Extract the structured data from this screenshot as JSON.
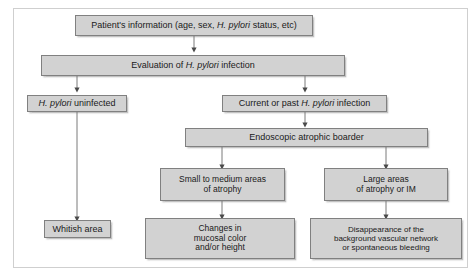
{
  "diagram": {
    "frame": {
      "border_color": "#cfcfcf",
      "background": "#ffffff"
    },
    "style": {
      "box_fill": "#d2d2d2",
      "box_border": "#808080",
      "text_color": "#1a1a1a",
      "connector_color": "#6e6e6e"
    },
    "nodes": [
      {
        "id": "patient-information",
        "label": "Patient's information (age, sex, H. pylori status, etc)",
        "italic_parts": [
          "H. pylori"
        ]
      },
      {
        "id": "evaluation-h-pylori-infection",
        "label": "Evaluation of H. pylori infection",
        "italic_parts": [
          "H. pylori"
        ]
      },
      {
        "id": "h-pylori-uninfected",
        "label": "H. pylori uninfected",
        "italic_parts": [
          "H. pylori"
        ]
      },
      {
        "id": "current-or-past-infection",
        "label": "Current or past H. pylori infection",
        "italic_parts": [
          "H. pylori"
        ]
      },
      {
        "id": "endoscopic-atrophic-boarder",
        "label": "Endoscopic atrophic boarder",
        "italic_parts": []
      },
      {
        "id": "small-to-medium-atrophy",
        "label": "Small to medium areas of atrophy",
        "lines": [
          "Small to medium areas",
          "of atrophy"
        ]
      },
      {
        "id": "large-areas-atrophy-im",
        "label": "Large areas of atrophy or IM",
        "lines": [
          "Large areas",
          "of atrophy or IM"
        ]
      },
      {
        "id": "whitish-area",
        "label": "Whitish area",
        "lines": [
          "Whitish area"
        ]
      },
      {
        "id": "changes-mucosal-color",
        "label": "Changes in mucosal color and/or height",
        "lines": [
          "Changes in",
          "mucosal color",
          "and/or height"
        ]
      },
      {
        "id": "disappearance-vascular-network",
        "label": "Disappearance of the background vascular network or spontaneous bleeding",
        "lines": [
          "Disappearance of the",
          "background vascular network",
          "or spontaneous bleeding"
        ]
      }
    ],
    "edges": [
      {
        "from": "patient-information",
        "to": "evaluation-h-pylori-infection"
      },
      {
        "from": "evaluation-h-pylori-infection",
        "to": "h-pylori-uninfected"
      },
      {
        "from": "evaluation-h-pylori-infection",
        "to": "current-or-past-infection"
      },
      {
        "from": "h-pylori-uninfected",
        "to": "whitish-area"
      },
      {
        "from": "current-or-past-infection",
        "to": "endoscopic-atrophic-boarder"
      },
      {
        "from": "endoscopic-atrophic-boarder",
        "to": "small-to-medium-atrophy"
      },
      {
        "from": "endoscopic-atrophic-boarder",
        "to": "large-areas-atrophy-im"
      },
      {
        "from": "small-to-medium-atrophy",
        "to": "changes-mucosal-color"
      },
      {
        "from": "large-areas-atrophy-im",
        "to": "disappearance-vascular-network"
      }
    ]
  }
}
